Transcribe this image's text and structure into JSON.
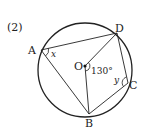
{
  "problem_label": "(2)",
  "points": {
    "A": {
      "label": "A"
    },
    "B": {
      "label": "B"
    },
    "C": {
      "label": "C"
    },
    "D": {
      "label": "D"
    },
    "O": {
      "label": "O"
    }
  },
  "angles": {
    "x": {
      "label": "x",
      "vertex": "A",
      "between": [
        "D",
        "B"
      ]
    },
    "y": {
      "label": "y",
      "vertex": "C",
      "between": [
        "D",
        "B"
      ]
    },
    "center": {
      "label": "130°",
      "vertex": "O",
      "between": [
        "D",
        "B"
      ]
    }
  },
  "colors": {
    "stroke": "#222222",
    "background": "#ffffff"
  }
}
